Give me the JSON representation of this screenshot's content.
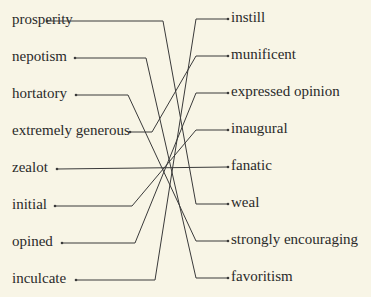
{
  "left": [
    {
      "label": "prosperity",
      "y": 21,
      "dot_x": 47,
      "elbow_x": 163
    },
    {
      "label": "nepotism",
      "y": 58,
      "dot_x": 75,
      "elbow_x": 146
    },
    {
      "label": "hortatory",
      "y": 95,
      "dot_x": 76,
      "elbow_x": 128
    },
    {
      "label": "extremely generous",
      "y": 132,
      "dot_x": 130,
      "elbow_x": 152
    },
    {
      "label": "zealot",
      "y": 169,
      "dot_x": 57,
      "elbow_x": null
    },
    {
      "label": "initial",
      "y": 206,
      "dot_x": 55,
      "elbow_x": 132
    },
    {
      "label": "opined",
      "y": 243,
      "dot_x": 62,
      "elbow_x": 135
    },
    {
      "label": "inculcate",
      "y": 280,
      "dot_x": 76,
      "elbow_x": 155
    }
  ],
  "right": [
    {
      "label": "instill",
      "y": 19,
      "dot_x": 228,
      "elbow_x": 196
    },
    {
      "label": "munificent",
      "y": 56,
      "dot_x": 228,
      "elbow_x": 196
    },
    {
      "label": "expressed opinion",
      "y": 93,
      "dot_x": 228,
      "elbow_x": 196
    },
    {
      "label": "inaugural",
      "y": 130,
      "dot_x": 228,
      "elbow_x": 196
    },
    {
      "label": "fanatic",
      "y": 167,
      "dot_x": 228,
      "elbow_x": null
    },
    {
      "label": "weal",
      "y": 204,
      "dot_x": 228,
      "elbow_x": 196
    },
    {
      "label": "strongly encouraging",
      "y": 241,
      "dot_x": 228,
      "elbow_x": 196
    },
    {
      "label": "favoritism",
      "y": 278,
      "dot_x": 228,
      "elbow_x": 196
    }
  ],
  "connections": [
    [
      0,
      5
    ],
    [
      1,
      7
    ],
    [
      2,
      6
    ],
    [
      3,
      1
    ],
    [
      4,
      4
    ],
    [
      5,
      3
    ],
    [
      6,
      2
    ],
    [
      7,
      0
    ]
  ],
  "line_color": "#3a3a3a"
}
